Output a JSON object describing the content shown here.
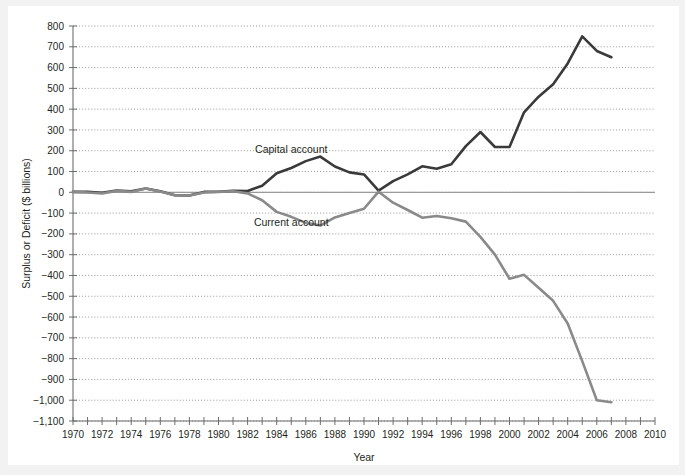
{
  "figure": {
    "background": "#f2f2f2",
    "plot_background": "#ffffff"
  },
  "chart_data": {
    "type": "line",
    "title": "",
    "xlabel": "Year",
    "ylabel": "Surplus or Deficit ($ billions)",
    "xlim": [
      1970,
      2010
    ],
    "ylim": [
      -1100,
      800
    ],
    "grid": true,
    "legend": "inline-annotations",
    "y_ticks": [
      800,
      700,
      600,
      500,
      400,
      300,
      200,
      100,
      0,
      -100,
      -200,
      -300,
      -400,
      -500,
      -600,
      -700,
      -800,
      -900,
      -1000,
      -1100
    ],
    "y_tick_labels": [
      "800",
      "700",
      "600",
      "500",
      "400",
      "300",
      "200",
      "100",
      "0",
      "−100",
      "−200",
      "−300",
      "−400",
      "−500",
      "−600",
      "−700",
      "−800",
      "−900",
      "−1,000",
      "−1,100"
    ],
    "x_ticks": [
      1970,
      1971,
      1972,
      1973,
      1974,
      1975,
      1976,
      1977,
      1978,
      1979,
      1980,
      1981,
      1982,
      1983,
      1984,
      1985,
      1986,
      1987,
      1988,
      1989,
      1990,
      1991,
      1992,
      1993,
      1994,
      1995,
      1996,
      1997,
      1998,
      1999,
      2000,
      2001,
      2002,
      2003,
      2004,
      2005,
      2006,
      2007,
      2008,
      2009,
      2010
    ],
    "x_tick_labels_shown": [
      "1970",
      "1972",
      "1974",
      "1976",
      "1978",
      "1980",
      "1982",
      "1984",
      "1986",
      "1988",
      "1990",
      "1992",
      "1994",
      "1996",
      "1998",
      "2000",
      "2002",
      "2004",
      "2006",
      "2008",
      "2010"
    ],
    "x": [
      1970,
      1971,
      1972,
      1973,
      1974,
      1975,
      1976,
      1977,
      1978,
      1979,
      1980,
      1981,
      1982,
      1983,
      1984,
      1985,
      1986,
      1987,
      1988,
      1989,
      1990,
      1991,
      1992,
      1993,
      1994,
      1995,
      1996,
      1997,
      1998,
      1999,
      2000,
      2001,
      2002,
      2003,
      2004,
      2005,
      2006,
      2007
    ],
    "series": [
      {
        "name": "Capital account",
        "color": "#3a3a3a",
        "width": 2.6,
        "label_x": 1985,
        "label_y": 210,
        "values": [
          2,
          3,
          -2,
          9,
          5,
          18,
          5,
          -14,
          -15,
          2,
          3,
          7,
          6,
          32,
          92,
          117,
          150,
          172,
          124,
          96,
          86,
          8,
          54,
          86,
          125,
          113,
          135,
          222,
          290,
          218,
          218,
          385,
          460,
          520,
          620,
          750,
          680,
          650
        ]
      },
      {
        "name": "Current account",
        "color": "#8a8a8a",
        "width": 2.6,
        "label_x": 1985,
        "label_y": -145,
        "values": [
          2,
          -1,
          -6,
          7,
          2,
          18,
          4,
          -14,
          -15,
          -1,
          2,
          5,
          -5,
          -38,
          -94,
          -118,
          -147,
          -160,
          -121,
          -99,
          -79,
          3,
          -50,
          -85,
          -122,
          -114,
          -125,
          -141,
          -214,
          -300,
          -416,
          -397,
          -459,
          -522,
          -631,
          -812,
          -1000,
          -1010
        ]
      }
    ],
    "zero_line_color": "#9a9a9a"
  },
  "axes": {
    "y_title": "Surplus or Deficit ($ billions)",
    "x_title": "Year",
    "axis_color": "#6d6d6d",
    "grid_color": "#8c8c8c",
    "text_color": "#231f20"
  }
}
